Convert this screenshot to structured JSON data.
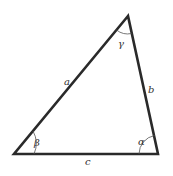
{
  "diagram": {
    "type": "triangle",
    "vertices": {
      "top": [
        128,
        16
      ],
      "bottom_left": [
        14,
        154
      ],
      "bottom_right": [
        158,
        154
      ]
    },
    "sides": {
      "a": "a",
      "b": "b",
      "c": "c"
    },
    "angles": {
      "alpha": "α",
      "beta": "β",
      "gamma": "γ"
    },
    "colors": {
      "stroke": "#2a2a2a",
      "arc": "#555555",
      "label": "#333333",
      "background": "#ffffff"
    }
  }
}
